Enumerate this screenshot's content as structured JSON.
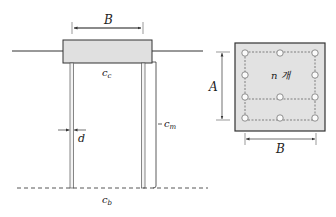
{
  "colors": {
    "stroke": "#333333",
    "cap_fill": "#e0e0e0",
    "pile_fill": "#f4f4f4",
    "background": "#ffffff"
  },
  "elevation_view": {
    "labels": {
      "cap_width": "B",
      "cap_contact": "c",
      "cap_contact_sub": "c",
      "pile_diameter": "d",
      "pile_shaft": "c",
      "pile_shaft_sub": "m",
      "base": "c",
      "base_sub": "b"
    },
    "piles_shown": 2
  },
  "plan_view": {
    "labels": {
      "depth": "A",
      "width": "B",
      "pile_count": "n 개"
    },
    "pile_grid": {
      "rows": 4,
      "columns": 3,
      "interior_omitted": true
    }
  }
}
